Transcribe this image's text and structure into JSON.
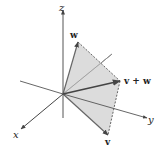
{
  "diagram": {
    "axes": {
      "x_label": "x",
      "y_label": "y",
      "z_label": "z"
    },
    "vectors": {
      "w_label": "w",
      "v_label": "v",
      "sum_label": "v + w"
    },
    "colors": {
      "plane_fill": "#d6d6d6",
      "axis": "#444444",
      "vector": "#555555",
      "dashed_edge": "#555555"
    },
    "points": {
      "origin": [
        63,
        94
      ],
      "w_tip": [
        78,
        42
      ],
      "v_tip": [
        108,
        135
      ],
      "sum_tip": [
        120,
        81
      ]
    }
  }
}
